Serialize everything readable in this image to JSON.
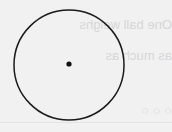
{
  "diagram": {
    "type": "circle-with-center-point",
    "circle": {
      "cx": 69,
      "cy": 65,
      "r": 55,
      "stroke": "#1a1a1a",
      "stroke_width": 1.5
    },
    "center_point": {
      "cx": 69,
      "cy": 64,
      "r": 2.6,
      "fill": "#111111"
    }
  },
  "bleed_through_text": {
    "line1": "One ball weighs",
    "line2": "as much as",
    "line3": "○ ○ ○"
  },
  "colors": {
    "background": "#f1f1f1",
    "stroke": "#1a1a1a",
    "ghost_text": "#d6d6d6"
  }
}
